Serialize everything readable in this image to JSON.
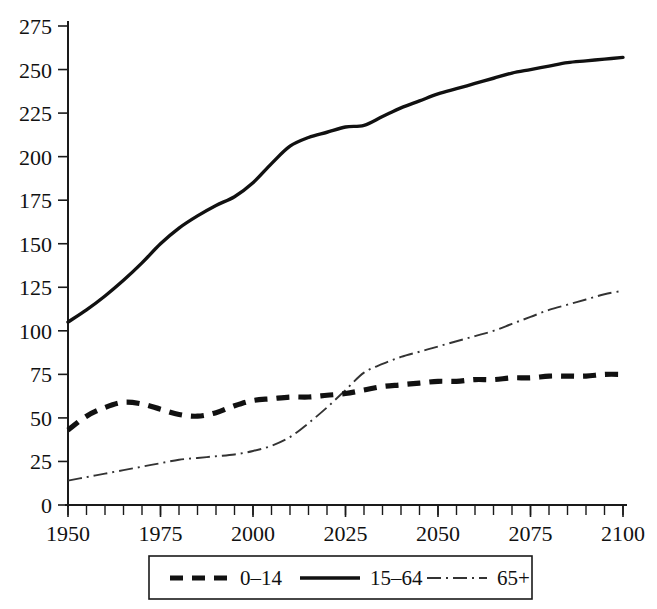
{
  "chart_data": {
    "type": "line",
    "title": "",
    "xlabel": "",
    "ylabel": "",
    "xlim": [
      1950,
      2100
    ],
    "ylim": [
      0,
      275
    ],
    "grid": false,
    "legend_position": "bottom",
    "x_ticks": [
      1950,
      1975,
      2000,
      2025,
      2050,
      2075,
      2100
    ],
    "x_tick_labels": [
      "1950",
      "1975",
      "2000",
      "2025",
      "2050",
      "2075",
      "2100"
    ],
    "x_minor_tick_step": 5,
    "y_ticks": [
      0,
      25,
      50,
      75,
      100,
      125,
      150,
      175,
      200,
      225,
      250,
      275
    ],
    "y_tick_labels": [
      "0",
      "25",
      "50",
      "75",
      "100",
      "125",
      "150",
      "175",
      "200",
      "225",
      "250",
      "275"
    ],
    "x": [
      1950,
      1955,
      1960,
      1965,
      1970,
      1975,
      1980,
      1985,
      1990,
      1995,
      2000,
      2005,
      2010,
      2015,
      2020,
      2025,
      2030,
      2035,
      2040,
      2045,
      2050,
      2055,
      2060,
      2065,
      2070,
      2075,
      2080,
      2085,
      2090,
      2095,
      2100
    ],
    "series": [
      {
        "name": "0-14",
        "label": "0–14",
        "style": "thick-dashed",
        "color": "#111111",
        "values": [
          43,
          51,
          56,
          59,
          58,
          55,
          52,
          51,
          53,
          57,
          60,
          61,
          62,
          62,
          63,
          64,
          66,
          68,
          69,
          70,
          71,
          71,
          72,
          72,
          73,
          73,
          74,
          74,
          74,
          75,
          75
        ]
      },
      {
        "name": "15-64",
        "label": "15–64",
        "style": "thick-solid",
        "color": "#111111",
        "values": [
          105,
          112,
          120,
          129,
          139,
          150,
          159,
          166,
          172,
          177,
          185,
          196,
          206,
          211,
          214,
          217,
          218,
          223,
          228,
          232,
          236,
          239,
          242,
          245,
          248,
          250,
          252,
          254,
          255,
          256,
          257
        ]
      },
      {
        "name": "65+",
        "label": "65+",
        "style": "thin-dash-dot",
        "color": "#333333",
        "values": [
          14,
          16,
          18,
          20,
          22,
          24,
          26,
          27,
          28,
          29,
          31,
          34,
          39,
          47,
          56,
          66,
          76,
          81,
          85,
          88,
          91,
          94,
          97,
          100,
          104,
          108,
          112,
          115,
          118,
          121,
          123
        ]
      }
    ],
    "legend": [
      {
        "label": "0–14",
        "style": "thick-dashed"
      },
      {
        "label": "15–64",
        "style": "thick-solid"
      },
      {
        "label": "65+",
        "style": "thin-dash-dot"
      }
    ]
  }
}
